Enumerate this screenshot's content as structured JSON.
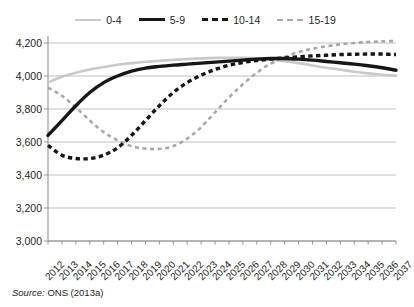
{
  "legend": {
    "position": "top-center",
    "entries": [
      {
        "label": "0-4",
        "style": "solid-light",
        "color": "#c9c9c9"
      },
      {
        "label": "5-9",
        "style": "solid-dark",
        "color": "#161616"
      },
      {
        "label": "10-14",
        "style": "dash-dark",
        "color": "#161616"
      },
      {
        "label": "15-19",
        "style": "dash-light",
        "color": "#a8a8a8"
      }
    ]
  },
  "source": {
    "lead": "Source:",
    "text": " ONS (2013a)"
  },
  "axes": {
    "y_ticks": [
      "4,200",
      "4,000",
      "3,800",
      "3,600",
      "3,400",
      "3,200",
      "3,000"
    ],
    "x_ticks": [
      "2012",
      "2013",
      "2014",
      "2015",
      "2016",
      "2017",
      "2018",
      "2019",
      "2020",
      "2021",
      "2022",
      "2023",
      "2024",
      "2025",
      "2026",
      "2027",
      "2028",
      "2029",
      "2030",
      "2031",
      "2032",
      "2033",
      "2034",
      "2035",
      "2036",
      "2037"
    ]
  },
  "chart_data": {
    "type": "line",
    "title": "",
    "subtitle": "",
    "xlabel": "",
    "ylabel": "",
    "xlim": [
      2012,
      2037
    ],
    "ylim": [
      3000,
      4200
    ],
    "ytick_step": 200,
    "grid": true,
    "grid_axis": "y",
    "legend_position": "top-center",
    "source": "Source: ONS (2013a)",
    "x": [
      2012,
      2013,
      2014,
      2015,
      2016,
      2017,
      2018,
      2019,
      2020,
      2021,
      2022,
      2023,
      2024,
      2025,
      2026,
      2027,
      2028,
      2029,
      2030,
      2031,
      2032,
      2033,
      2034,
      2035,
      2036,
      2037
    ],
    "series": [
      {
        "name": "0-4",
        "style": "solid",
        "color": "#c9c9c9",
        "width": 2.6,
        "values": [
          3960,
          3995,
          4020,
          4040,
          4055,
          4068,
          4078,
          4086,
          4092,
          4098,
          4103,
          4107,
          4110,
          4111,
          4110,
          4107,
          4100,
          4090,
          4078,
          4064,
          4050,
          4038,
          4026,
          4016,
          4008,
          4002
        ]
      },
      {
        "name": "5-9",
        "style": "solid",
        "color": "#161616",
        "width": 3.4,
        "values": [
          3640,
          3730,
          3820,
          3900,
          3960,
          4000,
          4030,
          4048,
          4058,
          4066,
          4072,
          4078,
          4084,
          4090,
          4096,
          4102,
          4106,
          4106,
          4102,
          4096,
          4088,
          4080,
          4072,
          4062,
          4050,
          4035
        ]
      },
      {
        "name": "10-14",
        "style": "dashed",
        "color": "#161616",
        "width": 3.4,
        "values": [
          3580,
          3520,
          3500,
          3500,
          3520,
          3565,
          3640,
          3730,
          3820,
          3900,
          3960,
          4005,
          4040,
          4065,
          4082,
          4094,
          4102,
          4110,
          4116,
          4122,
          4126,
          4130,
          4132,
          4133,
          4133,
          4130
        ]
      },
      {
        "name": "15-19",
        "style": "dashed",
        "color": "#a8a8a8",
        "width": 2.6,
        "values": [
          3930,
          3880,
          3810,
          3730,
          3660,
          3610,
          3575,
          3560,
          3558,
          3575,
          3620,
          3690,
          3780,
          3870,
          3950,
          4020,
          4075,
          4115,
          4145,
          4165,
          4180,
          4192,
          4200,
          4206,
          4210,
          4212
        ]
      }
    ]
  }
}
